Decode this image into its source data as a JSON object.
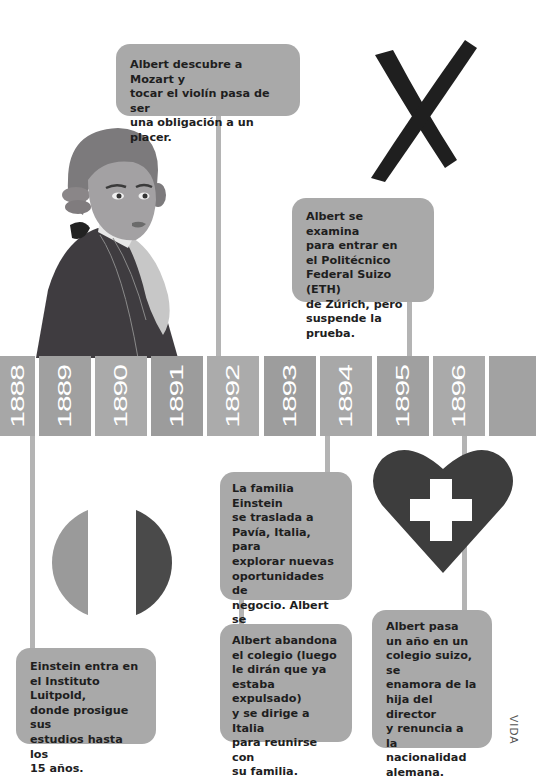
{
  "timeline": {
    "years": [
      {
        "label": "1888",
        "left": 0,
        "width": 35,
        "color": "#a7a7a7"
      },
      {
        "label": "1889",
        "left": 39,
        "width": 52,
        "color": "#a0a0a0"
      },
      {
        "label": "1890",
        "left": 95,
        "width": 52,
        "color": "#aaaaaa"
      },
      {
        "label": "1891",
        "left": 151,
        "width": 52,
        "color": "#9c9c9c"
      },
      {
        "label": "1892",
        "left": 207,
        "width": 52,
        "color": "#ababab"
      },
      {
        "label": "1893",
        "left": 264,
        "width": 52,
        "color": "#9d9d9d"
      },
      {
        "label": "1894",
        "left": 320,
        "width": 52,
        "color": "#a8a8a8"
      },
      {
        "label": "1895",
        "left": 377,
        "width": 52,
        "color": "#a0a0a0"
      },
      {
        "label": "1896",
        "left": 433,
        "width": 52,
        "color": "#aaaaaa"
      },
      {
        "label": "",
        "left": 489,
        "width": 47,
        "color": "#a2a2a2"
      }
    ]
  },
  "events": {
    "mozart": "Albert descubre a Mozart y\ntocar el violín pasa de ser\nuna obligación a un placer.",
    "eth": "Albert se examina\npara entrar en\nel Politécnico\nFederal Suizo (ETH)\nde Zúrich, pero\nsuspende la prueba.",
    "pavia": "La familia Einstein\nse traslada a\nPavía, Italia, para\nexplorar nuevas\noportunidades de\nnegocio. Albert se\nqueda estudiando\nen Múnich.",
    "abandona": "Albert abandona\nel colegio (luego\nle dirán que ya\nestaba expulsado)\ny se dirige a Italia\npara reunirse con\nsu familia.",
    "luitpold": "Einstein entra en\nel Instituto Luitpold,\ndonde prosigue sus\nestudios hasta los\n15 años.",
    "suizo": "Albert pasa\nun año en un\ncolegio suizo, se\nenamora de la\nhija del director\ny renuncia a la\nnacionalidad\nalemana."
  },
  "icons": {
    "cross_mark": "x-mark-icon",
    "heart_cross": "swiss-heart-icon",
    "italy_flag": "italy-flag-icon",
    "portrait": "mozart-portrait"
  },
  "footer": {
    "section_label": "VIDA"
  },
  "colors": {
    "box": "#a9a9a9",
    "connector": "#b4b4b4",
    "dark": "#3d3d3d",
    "text": "#1e1e1e"
  }
}
